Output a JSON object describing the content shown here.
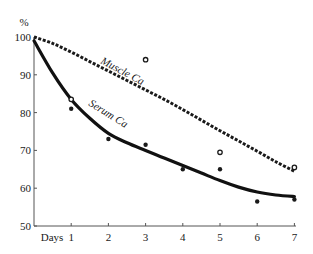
{
  "chart_data": {
    "type": "line",
    "title": "",
    "xlabel": "Days",
    "ylabel": "%",
    "xlim": [
      0,
      7
    ],
    "ylim": [
      50,
      100
    ],
    "x_ticks": [
      "1",
      "2",
      "3",
      "4",
      "5",
      "6",
      "7"
    ],
    "y_ticks": [
      "50",
      "60",
      "70",
      "80",
      "90",
      "100"
    ],
    "grid": false,
    "legend": "none (curves labeled inline)",
    "series": [
      {
        "name": "Muscle Ca",
        "style": "dashed curve with open-circle observations",
        "curve": {
          "x": [
            0,
            0.5,
            1,
            1.5,
            2,
            2.5,
            3,
            3.5,
            4,
            4.5,
            5,
            5.5,
            6,
            6.5,
            7
          ],
          "y": [
            100,
            98.3,
            96,
            93.5,
            91,
            88.5,
            86,
            83.5,
            80.8,
            78,
            75.2,
            72.5,
            69.8,
            67,
            64.5
          ]
        },
        "points": {
          "x": [
            1,
            3,
            5,
            7
          ],
          "y": [
            83.5,
            94,
            69.5,
            65.5
          ]
        }
      },
      {
        "name": "Serum Ca",
        "style": "solid thick curve with filled-dot observations",
        "curve": {
          "x": [
            0,
            0.5,
            1,
            1.5,
            2,
            2.5,
            3,
            3.5,
            4,
            4.5,
            5,
            5.5,
            6,
            6.5,
            7
          ],
          "y": [
            99,
            90.5,
            83.5,
            78.5,
            74.5,
            72,
            70,
            68,
            66,
            64,
            62,
            60.3,
            59,
            58.2,
            57.8
          ]
        },
        "points": {
          "x": [
            1,
            2,
            3,
            4,
            5,
            6,
            7
          ],
          "y": [
            81,
            73,
            71.5,
            65,
            65,
            56.5,
            57
          ]
        }
      }
    ],
    "annotations": [
      "Muscle Ca",
      "Serum Ca"
    ]
  },
  "axes": {
    "y_unit": "%",
    "x_title": "Days",
    "y_labels": [
      "100",
      "90",
      "80",
      "70",
      "60",
      "50"
    ],
    "x_labels": [
      "1",
      "2",
      "3",
      "4",
      "5",
      "6",
      "7"
    ]
  },
  "labels": {
    "muscle": "Muscle Ca",
    "serum": "Serum Ca"
  },
  "colors": {
    "ink": "#1a1a1a",
    "axis": "#555555",
    "background": "#ffffff"
  }
}
